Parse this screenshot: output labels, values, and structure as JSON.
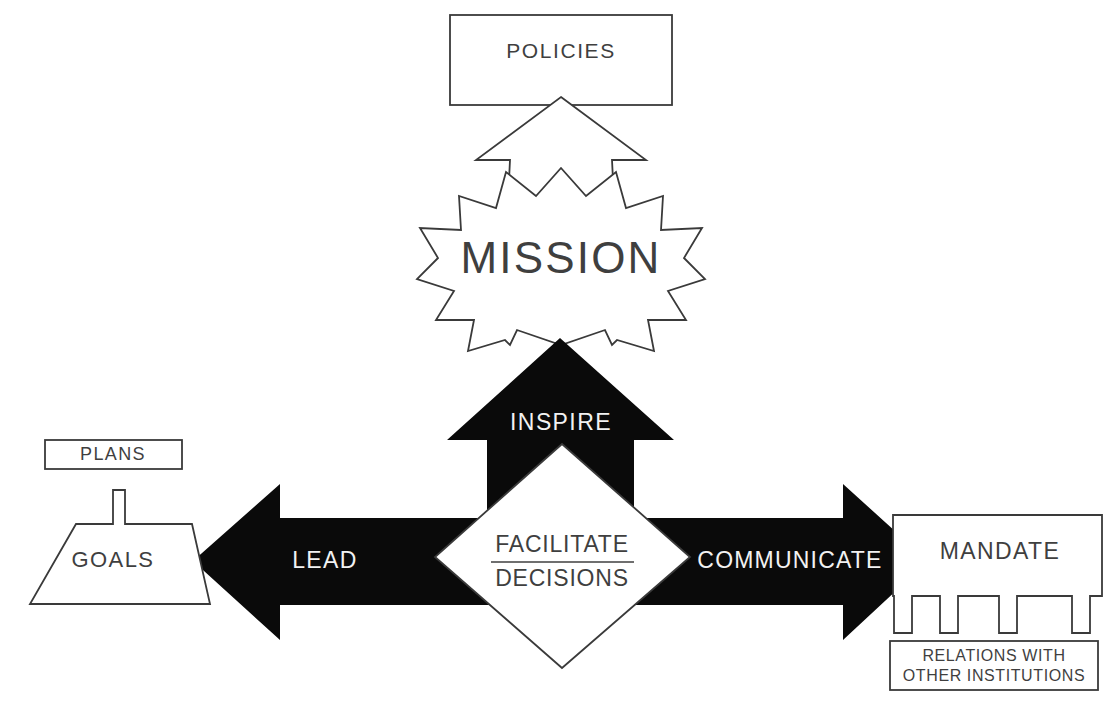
{
  "diagram": {
    "colors": {
      "ink": "#3a3a3a",
      "fill_white": "#ffffff",
      "fill_black": "#0a0a0a",
      "text_light": "#f2f2f2",
      "text_dark": "#3f3f3f"
    },
    "nodes": {
      "policies": {
        "label": "POLICIES",
        "shape": "rectangle",
        "fill": "white"
      },
      "mission": {
        "label": "MISSION",
        "shape": "starburst",
        "fill": "white"
      },
      "goals": {
        "label": "GOALS",
        "shape": "trapezoid",
        "fill": "white"
      },
      "plans": {
        "label": "PLANS",
        "shape": "rectangle",
        "fill": "white"
      },
      "mandate": {
        "label": "MANDATE",
        "shape": "comb-rectangle",
        "fill": "white"
      },
      "relations": {
        "label_line1": "RELATIONS WITH",
        "label_line2": "OTHER INSTITUTIONS",
        "shape": "rectangle",
        "fill": "white"
      },
      "decisions": {
        "label_line1": "FACILITATE",
        "label_line2": "DECISIONS",
        "shape": "diamond",
        "fill": "white"
      }
    },
    "arrows": {
      "up_white": {
        "label": "",
        "direction": "up",
        "fill": "white",
        "from": "mission",
        "to": "policies"
      },
      "up_black": {
        "label": "INSPIRE",
        "direction": "up",
        "fill": "black",
        "from": "decisions",
        "to": "mission"
      },
      "left_black": {
        "label": "LEAD",
        "direction": "left",
        "fill": "black",
        "from": "decisions",
        "to": "goals"
      },
      "right_black": {
        "label": "COMMUNICATE",
        "direction": "right",
        "fill": "black",
        "from": "decisions",
        "to": "mandate"
      }
    },
    "caption": ""
  }
}
